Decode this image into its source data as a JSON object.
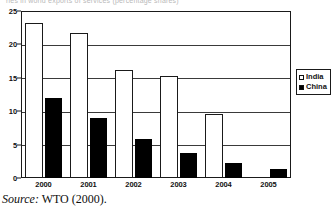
{
  "figure": {
    "title_remnant": "ries in world exports of services (percentage shares)",
    "source_label": "Source:",
    "source_text": "WTO (2000)."
  },
  "chart_data": {
    "type": "bar",
    "title": "",
    "xlabel": "",
    "ylabel": "",
    "categories": [
      "2000",
      "2001",
      "2002",
      "2003",
      "2004",
      "2005"
    ],
    "series": [
      {
        "name": "India",
        "color": "#ffffff",
        "values": [
          23.2,
          21.7,
          16.2,
          15.3,
          9.6,
          0
        ]
      },
      {
        "name": "China",
        "color": "#000000",
        "values": [
          12.0,
          9.0,
          5.9,
          3.7,
          2.3,
          1.4
        ]
      }
    ],
    "ylim": [
      0,
      25
    ],
    "yticks": [
      0,
      5,
      10,
      15,
      20,
      25
    ],
    "grid": true,
    "legend_position": "right-outside"
  },
  "legend": {
    "entries": [
      {
        "label": "India",
        "swatch": "hollow-square-icon"
      },
      {
        "label": "China",
        "swatch": "filled-square-icon"
      }
    ]
  }
}
